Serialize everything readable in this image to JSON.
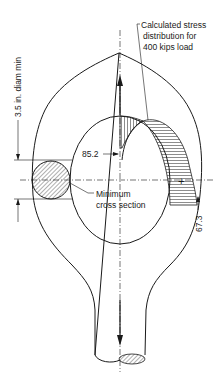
{
  "diagram": {
    "type": "engineering-drawing",
    "labels": {
      "stress_note_line1": "Calculated stress",
      "stress_note_line2": "distribution for",
      "stress_note_line3": "400 kips load",
      "inner_stress_value": "85.2",
      "outer_stress_value": "67.3",
      "min_section_line1": "Minimum",
      "min_section_line2": "cross section",
      "diameter_dim": "3.5 in. diam min"
    },
    "markers": {
      "compression_sign": "+"
    },
    "colors": {
      "line": "#1a1a1a",
      "background": "#ffffff"
    }
  }
}
